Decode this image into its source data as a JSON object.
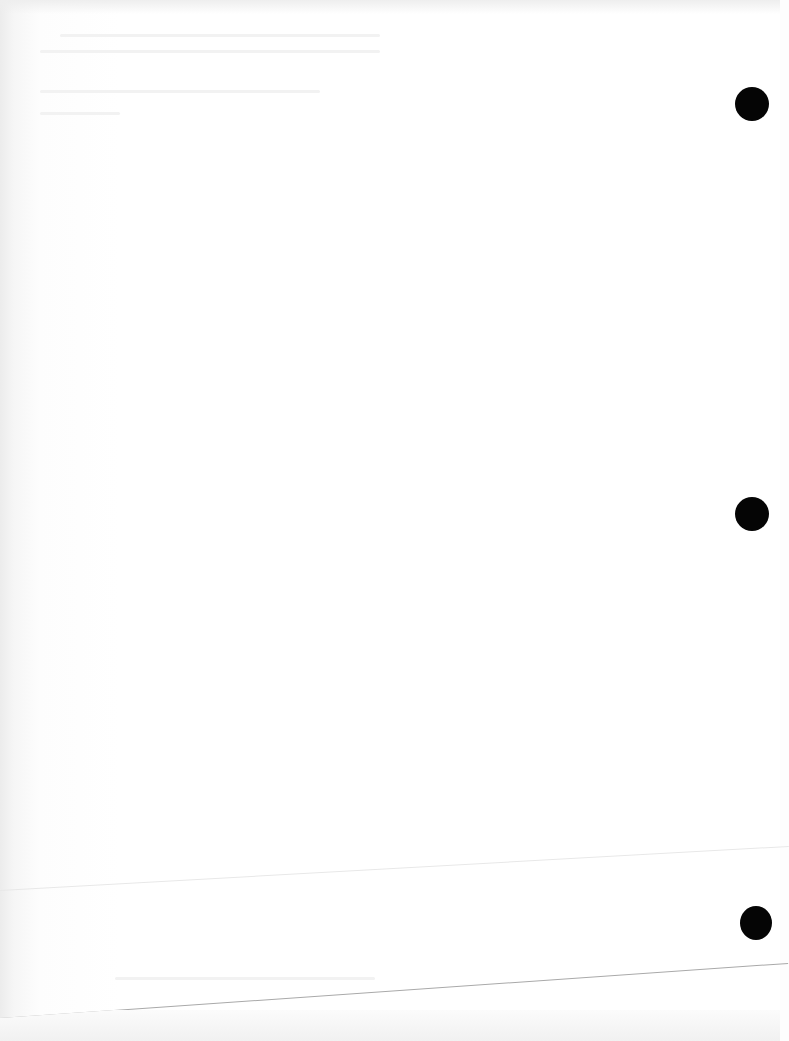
{
  "document": {
    "type": "scanned blank page",
    "text_content": "",
    "punch_holes": [
      {
        "x": 735,
        "y": 87,
        "size": 34
      },
      {
        "x": 735,
        "y": 497,
        "size": 34
      },
      {
        "x": 738,
        "y": 906,
        "size": 32
      }
    ],
    "colors": {
      "paper": "#ffffff",
      "hole": "#050505",
      "edge_line": "#a9a9a9",
      "margin_shade": "#ececec"
    }
  }
}
